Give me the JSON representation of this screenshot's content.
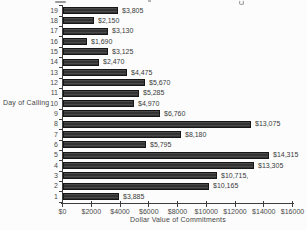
{
  "figure": {
    "background": "#fcfcfc",
    "axis_color": "#3d3d3d",
    "text_color": "#3e3e3e",
    "bar_fill": "#333333",
    "bar_stripe": "#4a4a4a",
    "bar_border": "#161616"
  },
  "chart_data": {
    "type": "bar",
    "orientation": "horizontal",
    "title": "",
    "xlabel": "Dollar Value of Commitments",
    "ylabel": "Day of Calling",
    "categories": [
      "19",
      "18",
      "17",
      "16",
      "15",
      "14",
      "13",
      "12",
      "11",
      "10",
      "9",
      "8",
      "7",
      "6",
      "5",
      "4",
      "3",
      "2",
      "1"
    ],
    "values": [
      3805,
      2150,
      3130,
      1690,
      3125,
      2470,
      4475,
      5670,
      5285,
      4970,
      6760,
      13075,
      8180,
      5795,
      14315,
      13305,
      10715,
      10165,
      3885
    ],
    "value_labels": [
      "$3,805",
      "$2,150",
      "$3,130",
      "$1,690",
      "$3,125",
      "$2,470",
      "$4,475",
      "$5,670",
      "$5,285",
      "$4,970",
      "$6,760",
      "$13,075",
      "$8,180",
      "$5,795",
      "$14,315",
      "$13,305",
      "$10,715,",
      "$10,165",
      "$3,885"
    ],
    "x_tick_labels": [
      "$0",
      "$2000",
      "$4000",
      "$6000",
      "$8000",
      "$10000",
      "$12000",
      "$14000",
      "$16000"
    ],
    "x_tick_values": [
      0,
      2000,
      4000,
      6000,
      8000,
      10000,
      12000,
      14000,
      16000
    ],
    "xlim": [
      0,
      16000
    ],
    "grid": false,
    "legend": false,
    "value_labels_position": "right-of-bar"
  }
}
